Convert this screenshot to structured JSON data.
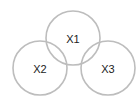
{
  "diagram": {
    "type": "venn",
    "stroke_color": "#bdbdbd",
    "label_color": "#222222",
    "sets": [
      {
        "label": "X1",
        "cx": 73,
        "cy": 38,
        "r": 27
      },
      {
        "label": "X2",
        "cx": 40,
        "cy": 68,
        "r": 27
      },
      {
        "label": "X3",
        "cx": 108,
        "cy": 68,
        "r": 27
      }
    ]
  }
}
